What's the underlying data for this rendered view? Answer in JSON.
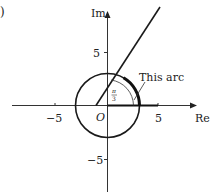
{
  "figure": {
    "part_label": ")",
    "axes": {
      "x_label": "Re",
      "y_label": "Im",
      "origin_label": "O",
      "x_ticks": [
        {
          "value": -5,
          "label": "−5"
        },
        {
          "value": 5,
          "label": "5"
        }
      ],
      "y_ticks": [
        {
          "value": 5,
          "label": "5"
        },
        {
          "value": -5,
          "label": "−5"
        }
      ]
    },
    "circle": {
      "center": [
        0,
        0
      ],
      "radius": 3
    },
    "half_line": {
      "from": [
        0,
        0
      ],
      "angle": "π/3"
    },
    "angle_marker": {
      "numerator": "π",
      "denominator": "3"
    },
    "annotation": "This arc",
    "highlighted": {
      "arc": {
        "from_angle": 0,
        "to_angle": "π/3"
      },
      "segment_on_real_axis": {
        "from": 0,
        "to": 5
      }
    },
    "colors": {
      "line": "#1a1a1a",
      "axis": "#333333"
    }
  }
}
